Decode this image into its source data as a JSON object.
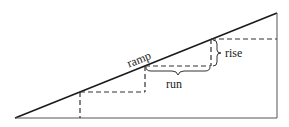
{
  "diagram": {
    "labels": {
      "ramp": "ramp",
      "run": "run",
      "rise": "rise"
    },
    "colors": {
      "line": "#1a1a1a",
      "dashed": "#333333",
      "background": "#ffffff"
    }
  }
}
